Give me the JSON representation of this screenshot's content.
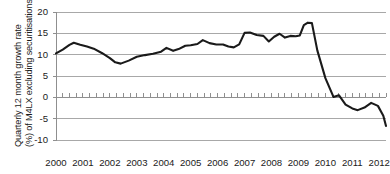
{
  "chart_data": {
    "type": "line",
    "title": "",
    "subtitle": "",
    "xlabel": "",
    "ylabel": "Quarterly 12 month growth rate (%) of M4LX excluding securitisations",
    "ylabel_line1": "Quarterly 12 month growth rate",
    "ylabel_line2": "(%) of M4LX excluding securitisations",
    "xlim": [
      2000.0,
      2012.25
    ],
    "ylim": [
      -10,
      20
    ],
    "ytick_labels": [
      "20",
      "15",
      "10",
      "5",
      "0",
      "-5",
      "-10"
    ],
    "ytick_values": [
      20,
      15,
      10,
      5,
      0,
      -5,
      -10
    ],
    "xtick_labels": [
      "2000",
      "2001",
      "2002",
      "2003",
      "2004",
      "2005",
      "2006",
      "2007",
      "2008",
      "2009",
      "2010",
      "2011",
      "2012"
    ],
    "xtick_values": [
      2000,
      2001,
      2002,
      2003,
      2004,
      2005,
      2006,
      2007,
      2008,
      2009,
      2010,
      2011,
      2012
    ],
    "grid": true,
    "grid_axis": "y",
    "legend": false,
    "legend_position": "none",
    "minor_ticks": "quarterly-on-zero-line",
    "line_color": "#1a1a1a",
    "grid_color": "#a8a8a8",
    "axis_color": "#8f8f8f",
    "background_color": "#ffffff",
    "series": [
      {
        "name": "Quarterly 12 month growth rate of M4LX excluding securitisations",
        "x": [
          2000.0,
          2000.25,
          2000.5,
          2000.75,
          2001.0,
          2001.25,
          2001.5,
          2001.75,
          2002.0,
          2002.25,
          2002.5,
          2002.75,
          2003.0,
          2003.25,
          2003.5,
          2003.75,
          2004.0,
          2004.25,
          2004.5,
          2004.75,
          2005.0,
          2005.25,
          2005.5,
          2005.75,
          2006.0,
          2006.25,
          2006.5,
          2006.75,
          2007.0,
          2007.25,
          2007.5,
          2007.75,
          2008.0,
          2008.25,
          2008.5,
          2008.75,
          2009.0,
          2009.25,
          2009.5,
          2009.75,
          2010.0,
          2010.25,
          2010.5,
          2010.75,
          2011.0,
          2011.25,
          2011.5,
          2011.75,
          2012.0,
          2012.25
        ],
        "values": [
          10.3,
          11.0,
          12.2,
          12.8,
          12.3,
          11.9,
          11.3,
          10.5,
          9.4,
          8.3,
          7.9,
          8.6,
          9.5,
          9.9,
          10.1,
          10.6,
          11.5,
          10.9,
          11.2,
          12.0,
          12.2,
          12.4,
          13.4,
          12.6,
          12.4,
          12.4,
          11.9,
          11.7,
          12.3,
          15.0,
          15.2,
          14.7,
          14.4,
          13.1,
          14.2,
          14.9,
          14.0,
          14.4,
          14.3,
          14.5,
          16.9,
          17.5,
          17.4,
          11.0,
          4.5,
          0.2,
          0.5,
          -1.7,
          -2.6,
          -3.0
        ]
      }
    ],
    "annotations": []
  },
  "series_points": [
    [
      2000.0,
      10.3
    ],
    [
      2000.25,
      11.2
    ],
    [
      2000.5,
      12.3
    ],
    [
      2000.66,
      12.8
    ],
    [
      2000.9,
      12.3
    ],
    [
      2001.15,
      11.9
    ],
    [
      2001.4,
      11.4
    ],
    [
      2001.7,
      10.4
    ],
    [
      2002.0,
      9.2
    ],
    [
      2002.2,
      8.2
    ],
    [
      2002.4,
      7.9
    ],
    [
      2002.7,
      8.6
    ],
    [
      2003.0,
      9.5
    ],
    [
      2003.3,
      9.9
    ],
    [
      2003.6,
      10.2
    ],
    [
      2003.9,
      10.7
    ],
    [
      2004.1,
      11.6
    ],
    [
      2004.35,
      10.9
    ],
    [
      2004.55,
      11.3
    ],
    [
      2004.8,
      12.1
    ],
    [
      2005.0,
      12.2
    ],
    [
      2005.25,
      12.5
    ],
    [
      2005.45,
      13.4
    ],
    [
      2005.7,
      12.7
    ],
    [
      2005.95,
      12.4
    ],
    [
      2006.2,
      12.4
    ],
    [
      2006.4,
      11.9
    ],
    [
      2006.6,
      11.7
    ],
    [
      2006.8,
      12.4
    ],
    [
      2007.0,
      15.1
    ],
    [
      2007.2,
      15.2
    ],
    [
      2007.45,
      14.6
    ],
    [
      2007.7,
      14.4
    ],
    [
      2007.9,
      13.1
    ],
    [
      2008.1,
      14.2
    ],
    [
      2008.3,
      14.9
    ],
    [
      2008.5,
      14.0
    ],
    [
      2008.7,
      14.4
    ],
    [
      2008.9,
      14.3
    ],
    [
      2009.05,
      14.5
    ],
    [
      2009.2,
      16.9
    ],
    [
      2009.35,
      17.5
    ],
    [
      2009.5,
      17.4
    ],
    [
      2009.7,
      11.0
    ],
    [
      2010.0,
      4.5
    ],
    [
      2010.3,
      0.1
    ],
    [
      2010.5,
      0.5
    ],
    [
      2010.75,
      -1.7
    ],
    [
      2011.0,
      -2.6
    ],
    [
      2011.2,
      -3.0
    ],
    [
      2011.45,
      -2.4
    ],
    [
      2011.7,
      -1.3
    ],
    [
      2011.95,
      -2.0
    ],
    [
      2012.15,
      -4.3
    ],
    [
      2012.25,
      -6.7
    ]
  ]
}
